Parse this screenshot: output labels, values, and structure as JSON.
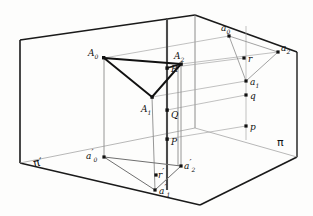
{
  "figure": {
    "planes": {
      "wall_label": "π",
      "floor_label": "π′"
    },
    "colors": {
      "box_edge": "#1a1a1a",
      "solid_line": "#111111",
      "projection_line": "#9a9a9a",
      "vertical_line": "#6f6f6f",
      "axis_line": "#4a4a4a",
      "point": "#111111",
      "background": "#fdfdfc"
    },
    "solid_triangle": {
      "name": "space-triangle",
      "vertices": [
        {
          "id": "A0",
          "label": "A",
          "sub": "0",
          "x": 104,
          "y": 58
        },
        {
          "id": "A1",
          "label": "A",
          "sub": "1",
          "x": 152,
          "y": 97
        },
        {
          "id": "A2",
          "label": "A",
          "sub": "2",
          "x": 181,
          "y": 64
        }
      ]
    },
    "floor_triangle": {
      "name": "floor-projection-triangle",
      "vertices": [
        {
          "id": "a0p",
          "label": "a",
          "sub": "0",
          "prime": "′",
          "x": 104,
          "y": 157
        },
        {
          "id": "a1p",
          "label": "a",
          "sub": "1",
          "prime": "′",
          "x": 155,
          "y": 190
        },
        {
          "id": "a2p",
          "label": "a",
          "sub": "2",
          "prime": "′",
          "x": 181,
          "y": 166
        }
      ]
    },
    "wall_triangle": {
      "name": "wall-projection-triangle",
      "vertices": [
        {
          "id": "a0",
          "label": "a",
          "sub": "0",
          "x": 229,
          "y": 36
        },
        {
          "id": "a1",
          "label": "a",
          "sub": "1",
          "x": 246,
          "y": 81
        },
        {
          "id": "a2",
          "label": "a",
          "sub": "2",
          "x": 278,
          "y": 52
        }
      ]
    },
    "axis_points": [
      {
        "id": "R",
        "label": "R",
        "x": 167,
        "y": 68
      },
      {
        "id": "Q",
        "label": "Q",
        "x": 167,
        "y": 110
      },
      {
        "id": "P",
        "label": "P",
        "x": 167,
        "y": 139
      }
    ],
    "wall_axis_points": [
      {
        "id": "r",
        "label": "r",
        "x": 244,
        "y": 58
      },
      {
        "id": "q",
        "label": "q",
        "x": 246,
        "y": 95
      },
      {
        "id": "p",
        "label": "p",
        "x": 246,
        "y": 126
      }
    ],
    "floor_axis_points": [
      {
        "id": "rp",
        "label": "r",
        "prime": "′",
        "x": 156,
        "y": 175
      }
    ]
  }
}
